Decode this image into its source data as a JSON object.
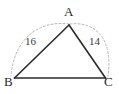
{
  "diagram": {
    "type": "geometry-triangle",
    "background_color": "#ffffff",
    "stroke_color": "#2b2b2b",
    "arc_color": "#b9b9b9",
    "vertices": [
      {
        "id": "A",
        "label": "A",
        "x": 69,
        "y": 25
      },
      {
        "id": "B",
        "label": "B",
        "x": 14,
        "y": 78
      },
      {
        "id": "C",
        "label": "C",
        "x": 106,
        "y": 78
      }
    ],
    "sides": [
      {
        "id": "AB",
        "from": "A",
        "to": "B",
        "length_label": "16"
      },
      {
        "id": "AC",
        "from": "A",
        "to": "C",
        "length_label": "14"
      },
      {
        "id": "BC",
        "from": "B",
        "to": "C",
        "length_label": ""
      }
    ],
    "arcs": [
      {
        "id": "arc-AB",
        "from": "A",
        "to": "B",
        "style": "dashed",
        "bulge": "outward-left"
      },
      {
        "id": "arc-AC",
        "from": "A",
        "to": "C",
        "style": "dashed",
        "bulge": "outward-right"
      }
    ]
  }
}
